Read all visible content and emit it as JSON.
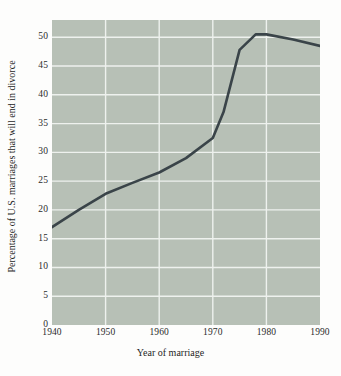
{
  "chart_data": {
    "type": "line",
    "title": "",
    "xlabel": "Year of marriage",
    "ylabel": "Percentage of U.S. marriages that will end in divorce",
    "xlim": [
      1940,
      1990
    ],
    "ylim": [
      0,
      53
    ],
    "xticks": [
      "1940",
      "1950",
      "1960",
      "1970",
      "1980",
      "1990"
    ],
    "xtick_values": [
      1940,
      1950,
      1960,
      1970,
      1980,
      1990
    ],
    "yticks": [
      "0",
      "5",
      "10",
      "15",
      "20",
      "25",
      "30",
      "35",
      "40",
      "45",
      "50"
    ],
    "ytick_values": [
      0,
      5,
      10,
      15,
      20,
      25,
      30,
      35,
      40,
      45,
      50
    ],
    "grid": true,
    "legend": "none",
    "series": [
      {
        "name": "Percentage of U.S. marriages that will end in divorce",
        "color": "#3a4449",
        "x": [
          1940,
          1945,
          1950,
          1955,
          1960,
          1965,
          1970,
          1972,
          1975,
          1978,
          1980,
          1985,
          1990
        ],
        "values": [
          17.0,
          20.0,
          22.8,
          24.7,
          26.5,
          29.0,
          32.5,
          37.0,
          47.8,
          50.5,
          50.5,
          49.6,
          48.5
        ]
      }
    ]
  },
  "axes": {
    "grid_color": "#eef1ee",
    "plot_background": "#b7c0b6",
    "page_background": "#fdfdfc",
    "tick_color": "#2b2b2b",
    "spine_color": "#4a4a4a"
  }
}
